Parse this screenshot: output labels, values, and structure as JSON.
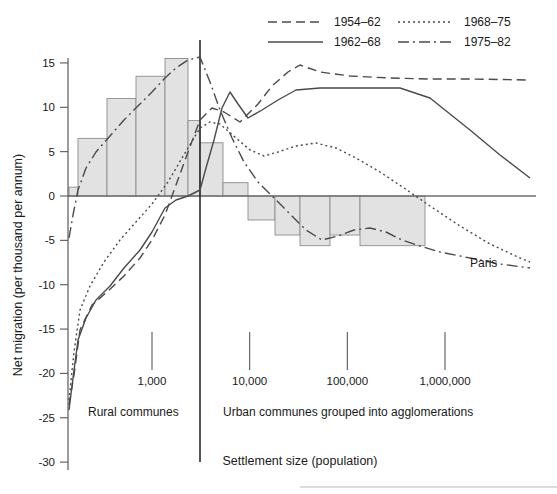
{
  "chart_data": {
    "type": "line",
    "title": "",
    "xlabel": "Settlement size (population)",
    "ylabel": "Net migration (per thousand per annum)",
    "xscale": "log",
    "xlim": [
      200,
      8000000
    ],
    "ylim": [
      -30,
      15
    ],
    "grid": false,
    "legend_position": "top",
    "x_tick_labels": [
      "1,000",
      "10,000",
      "100,000",
      "1,000,000"
    ],
    "x_tick_values": [
      1000,
      10000,
      100000,
      1000000
    ],
    "y_tick_labels": [
      "15",
      "10",
      "5",
      "0",
      "-5",
      "-10",
      "-15",
      "-20",
      "-25",
      "-30"
    ],
    "y_tick_values": [
      15,
      10,
      5,
      0,
      -5,
      -10,
      -15,
      -20,
      -25,
      -30
    ],
    "zone_labels": [
      {
        "text": "Rural communes",
        "x_px": 88,
        "y_px": 416
      },
      {
        "text": "Urban communes grouped into agglomerations",
        "x_px": 223,
        "y_px": 416
      }
    ],
    "annotations": [
      {
        "text": "Paris",
        "x_px": 470,
        "y_px": 267
      }
    ],
    "divider": {
      "label": "rural-urban divide",
      "x_px": 200
    },
    "bars": {
      "name": "Net migration by settlement size band",
      "values": [
        1.0,
        6.5,
        11.0,
        13.5,
        15.5,
        8.5,
        6.0,
        1.5,
        -2.7,
        -4.4,
        -5.6,
        -4.4,
        -5.6
      ],
      "edges_px": [
        69,
        78,
        107,
        136,
        165,
        188,
        200,
        223,
        248,
        275,
        300,
        330,
        360,
        425,
        530
      ]
    },
    "series": [
      {
        "name": "1954–62",
        "dash": "dashed",
        "dasharray": "9,5",
        "points_px": [
          [
            69,
            405
          ],
          [
            74,
            375
          ],
          [
            80,
            330
          ],
          [
            92,
            305
          ],
          [
            107,
            292
          ],
          [
            124,
            276
          ],
          [
            140,
            258
          ],
          [
            152,
            240
          ],
          [
            165,
            215
          ],
          [
            176,
            185
          ],
          [
            188,
            152
          ],
          [
            200,
            120
          ],
          [
            212,
            108
          ],
          [
            224,
            112
          ],
          [
            240,
            122
          ],
          [
            258,
            104
          ],
          [
            272,
            86
          ],
          [
            288,
            72
          ],
          [
            300,
            65
          ],
          [
            320,
            72
          ],
          [
            350,
            76
          ],
          [
            390,
            78
          ],
          [
            430,
            79
          ],
          [
            470,
            79
          ],
          [
            530,
            80
          ]
        ]
      },
      {
        "name": "1962–68",
        "dash": "solid",
        "dasharray": "",
        "points_px": [
          [
            69,
            410
          ],
          [
            73,
            378
          ],
          [
            78,
            340
          ],
          [
            86,
            318
          ],
          [
            96,
            300
          ],
          [
            110,
            286
          ],
          [
            124,
            268
          ],
          [
            140,
            250
          ],
          [
            152,
            232
          ],
          [
            165,
            208
          ],
          [
            176,
            200
          ],
          [
            188,
            196
          ],
          [
            196,
            192
          ],
          [
            200,
            190
          ],
          [
            206,
            168
          ],
          [
            214,
            140
          ],
          [
            222,
            108
          ],
          [
            230,
            92
          ],
          [
            238,
            104
          ],
          [
            248,
            118
          ],
          [
            262,
            110
          ],
          [
            278,
            100
          ],
          [
            296,
            90
          ],
          [
            320,
            88
          ],
          [
            360,
            88
          ],
          [
            400,
            88
          ],
          [
            430,
            98
          ],
          [
            470,
            130
          ],
          [
            500,
            155
          ],
          [
            530,
            178
          ]
        ]
      },
      {
        "name": "1968–75",
        "dash": "dotted",
        "dasharray": "2,3",
        "points_px": [
          [
            69,
            400
          ],
          [
            74,
            352
          ],
          [
            80,
            310
          ],
          [
            90,
            286
          ],
          [
            104,
            262
          ],
          [
            120,
            240
          ],
          [
            136,
            222
          ],
          [
            152,
            204
          ],
          [
            168,
            182
          ],
          [
            182,
            158
          ],
          [
            194,
            138
          ],
          [
            200,
            128
          ],
          [
            210,
            122
          ],
          [
            220,
            124
          ],
          [
            236,
            138
          ],
          [
            250,
            150
          ],
          [
            264,
            156
          ],
          [
            278,
            152
          ],
          [
            296,
            146
          ],
          [
            316,
            143
          ],
          [
            336,
            148
          ],
          [
            356,
            158
          ],
          [
            380,
            172
          ],
          [
            404,
            188
          ],
          [
            430,
            206
          ],
          [
            460,
            226
          ],
          [
            490,
            244
          ],
          [
            520,
            258
          ],
          [
            530,
            262
          ]
        ]
      },
      {
        "name": "1975–82",
        "dash": "dashdot",
        "dasharray": "11,4,2,4",
        "points_px": [
          [
            69,
            238
          ],
          [
            73,
            215
          ],
          [
            78,
            190
          ],
          [
            86,
            168
          ],
          [
            96,
            152
          ],
          [
            110,
            136
          ],
          [
            124,
            120
          ],
          [
            140,
            104
          ],
          [
            152,
            92
          ],
          [
            165,
            78
          ],
          [
            176,
            68
          ],
          [
            188,
            60
          ],
          [
            200,
            57
          ],
          [
            210,
            82
          ],
          [
            220,
            110
          ],
          [
            232,
            138
          ],
          [
            244,
            162
          ],
          [
            258,
            182
          ],
          [
            274,
            198
          ],
          [
            290,
            214
          ],
          [
            306,
            230
          ],
          [
            322,
            240
          ],
          [
            338,
            236
          ],
          [
            354,
            230
          ],
          [
            370,
            228
          ],
          [
            386,
            232
          ],
          [
            402,
            240
          ],
          [
            420,
            246
          ],
          [
            440,
            252
          ],
          [
            470,
            258
          ],
          [
            500,
            264
          ],
          [
            530,
            268
          ]
        ]
      }
    ]
  },
  "legend": {
    "entries": [
      {
        "label": "1954–62",
        "dasharray": "9,5"
      },
      {
        "label": "1968–75",
        "dasharray": "2,3"
      },
      {
        "label": "1962–68",
        "dasharray": ""
      },
      {
        "label": "1975–82",
        "dasharray": "11,4,2,4"
      }
    ]
  }
}
